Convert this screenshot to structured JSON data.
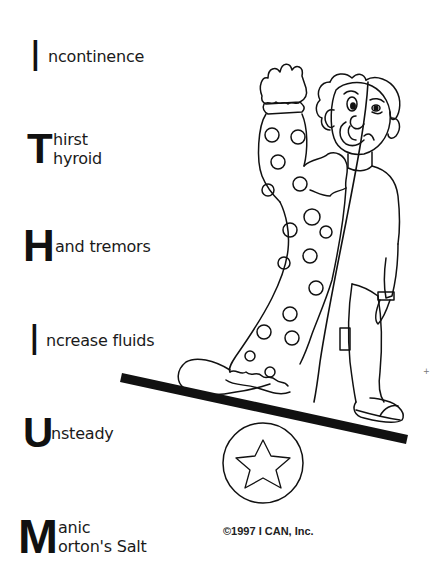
{
  "mnemonic": {
    "items": [
      {
        "letter": "I",
        "lines": [
          "ncontinence"
        ]
      },
      {
        "letter": "T",
        "lines": [
          "hirst",
          "hyroid"
        ]
      },
      {
        "letter": "H",
        "lines": [
          "and tremors"
        ]
      },
      {
        "letter": "I",
        "lines": [
          "ncrease fluids"
        ]
      },
      {
        "letter": "U",
        "lines": [
          "nsteady"
        ]
      },
      {
        "letter": "M",
        "lines": [
          "anic",
          "orton's Salt"
        ]
      }
    ]
  },
  "illustration": {
    "subject": "clown-half-person-balancing-on-seesaw",
    "ball_icon": "star-icon"
  },
  "footer": {
    "copyright": "©1997 I CAN, Inc."
  },
  "margin_mark": "+",
  "colors": {
    "ink": "#111111",
    "background": "#ffffff"
  }
}
